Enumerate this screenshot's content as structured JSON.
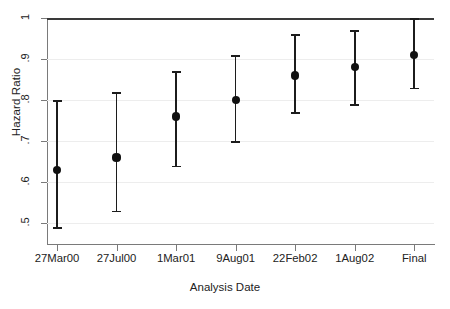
{
  "chart_data": {
    "type": "scatter",
    "title": "",
    "xlabel": "Analysis Date",
    "ylabel": "Hazard Ratio",
    "categories": [
      "27Mar00",
      "27Jul00",
      "1Mar01",
      "9Aug01",
      "22Feb02",
      "1Aug02",
      "Final"
    ],
    "values": [
      0.63,
      0.66,
      0.76,
      0.8,
      0.86,
      0.88,
      0.91
    ],
    "ci_lower": [
      0.49,
      0.53,
      0.64,
      0.7,
      0.77,
      0.79,
      0.83
    ],
    "ci_upper": [
      0.8,
      0.82,
      0.87,
      0.91,
      0.96,
      0.97,
      1.0
    ],
    "ylim": [
      0.49,
      1.0
    ],
    "yticks": [
      0.5,
      0.6,
      0.7,
      0.8,
      0.9,
      1.0
    ],
    "ytick_labels": [
      ".5",
      ".6",
      ".7",
      ".8",
      ".9",
      "1"
    ],
    "reference_line": 1.0,
    "grid": true,
    "legend": "none",
    "series": [
      {
        "name": "Hazard Ratio",
        "values": [
          0.63,
          0.66,
          0.76,
          0.8,
          0.86,
          0.88,
          0.91
        ]
      }
    ],
    "points": [
      {
        "x": "27Mar00",
        "estimate": 0.63,
        "lower": 0.49,
        "upper": 0.8
      },
      {
        "x": "27Jul00",
        "estimate": 0.66,
        "lower": 0.53,
        "upper": 0.82
      },
      {
        "x": "1Mar01",
        "estimate": 0.76,
        "lower": 0.64,
        "upper": 0.87
      },
      {
        "x": "9Aug01",
        "estimate": 0.8,
        "lower": 0.7,
        "upper": 0.91
      },
      {
        "x": "22Feb02",
        "estimate": 0.86,
        "lower": 0.77,
        "upper": 0.96
      },
      {
        "x": "1Aug02",
        "estimate": 0.88,
        "lower": 0.79,
        "upper": 0.97
      },
      {
        "x": "Final",
        "estimate": 0.91,
        "lower": 0.83,
        "upper": 1.0
      }
    ],
    "colors": {
      "marker": "#111111",
      "interval": "#1c1c1c",
      "grid": "#ededed",
      "axis": "#7a7a7a",
      "reference": "#3a3a3a",
      "text": "#222222",
      "background": "#ffffff"
    }
  }
}
